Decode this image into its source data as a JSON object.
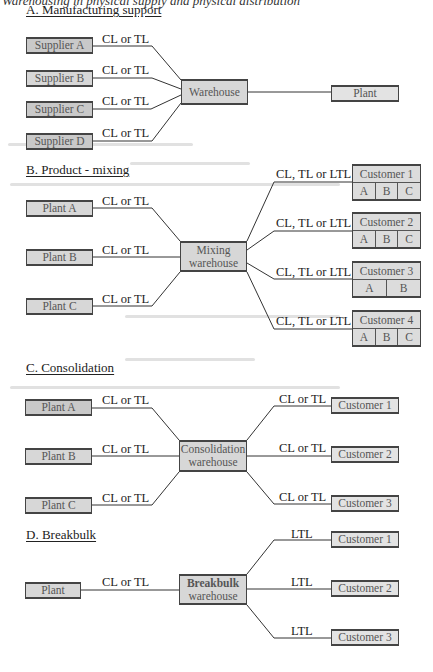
{
  "figure": {
    "caption": "Warehousing in physical supply and physical distribution",
    "sections": {
      "a": {
        "title": "A. Manufacturing support",
        "sources": [
          "Supplier A",
          "Supplier B",
          "Supplier C",
          "Supplier D"
        ],
        "source_link_label": "CL or TL",
        "hub": "Warehouse",
        "destination": "Plant"
      },
      "b": {
        "title": "B. Product - mixing",
        "sources": [
          "Plant A",
          "Plant B",
          "Plant C"
        ],
        "source_link_label": "CL or TL",
        "hub_line1": "Mixing",
        "hub_line2": "warehouse",
        "destination_link_label": "CL, TL or LTL",
        "customers": [
          {
            "name": "Customer 1",
            "products": [
              "A",
              "B",
              "C"
            ]
          },
          {
            "name": "Customer 2",
            "products": [
              "A",
              "B",
              "C"
            ]
          },
          {
            "name": "Customer 3",
            "products": [
              "A",
              "B"
            ]
          },
          {
            "name": "Customer 4",
            "products": [
              "A",
              "B",
              "C"
            ]
          }
        ]
      },
      "c": {
        "title": "C. Consolidation",
        "sources": [
          "Plant A",
          "Plant B",
          "Plant C"
        ],
        "source_link_label": "CL or TL",
        "hub_line1": "Consolidation",
        "hub_line2": "warehouse",
        "destination_link_label": "CL or TL",
        "customers": [
          "Customer 1",
          "Customer 2",
          "Customer 3"
        ]
      },
      "d": {
        "title": "D. Breakbulk",
        "source": "Plant",
        "source_link_label": "CL or TL",
        "hub_line1": "Breakbulk",
        "hub_line2": "warehouse",
        "destination_link_label": "LTL",
        "customers": [
          "Customer 1",
          "Customer 2",
          "Customer 3"
        ]
      }
    },
    "colors": {
      "box_fill": "#d7d7d7",
      "box_border": "#444444",
      "line": "#333333",
      "text": "#222222"
    }
  }
}
